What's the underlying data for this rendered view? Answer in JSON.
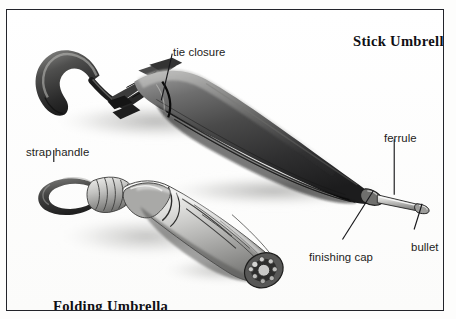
{
  "figure": {
    "name": "umbrella-parts-diagram",
    "medium": "pencil illustration",
    "background_color": "#fdfdfc",
    "border_color": "#23242a",
    "text_color": "#1d1d21"
  },
  "titles": {
    "stick": "Stick Umbrella",
    "folding": "Folding Umbrella"
  },
  "labels": {
    "tie_closure": "tie closure",
    "strap_handle": "strap handle",
    "ferrule": "ferrule",
    "finishing_cap": "finishing cap",
    "bullet": "bullet"
  },
  "leader_lines": [
    {
      "name": "tie-closure-leader",
      "from": [
        172,
        52
      ],
      "to": [
        160,
        98
      ]
    },
    {
      "name": "strap-handle-leader",
      "from": [
        52,
        150
      ],
      "to": [
        52,
        161
      ]
    },
    {
      "name": "ferrule-leader",
      "from": [
        394,
        138
      ],
      "to": [
        394,
        194
      ]
    },
    {
      "name": "finishing-cap-leader",
      "from": [
        343,
        239
      ],
      "to": [
        374,
        190
      ]
    },
    {
      "name": "bullet-leader",
      "from": [
        414,
        229
      ],
      "to": [
        423,
        202
      ]
    }
  ],
  "objects": [
    {
      "name": "stick-umbrella",
      "parts": [
        "crook handle",
        "tie closure",
        "rolled canopy",
        "finishing cap",
        "ferrule",
        "bullet"
      ]
    },
    {
      "name": "folding-umbrella",
      "parts": [
        "strap handle",
        "collar",
        "ribbed folded canopy",
        "end cap"
      ]
    }
  ]
}
